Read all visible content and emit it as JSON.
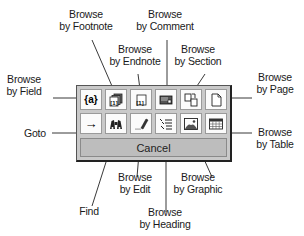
{
  "panel": {
    "row1": [
      {
        "id": "browse-by-field",
        "icon": "field-icon",
        "glyph": "{a}"
      },
      {
        "id": "browse-by-footnote",
        "icon": "footnote-icon",
        "glyph": "[1]"
      },
      {
        "id": "browse-by-endnote",
        "icon": "endnote-icon",
        "glyph": "[1]"
      },
      {
        "id": "browse-by-comment",
        "icon": "comment-icon",
        "glyph": ""
      },
      {
        "id": "browse-by-section",
        "icon": "section-icon",
        "glyph": ""
      },
      {
        "id": "browse-by-page",
        "icon": "page-icon",
        "glyph": ""
      }
    ],
    "row2": [
      {
        "id": "goto",
        "icon": "arrow-right-icon",
        "glyph": "→"
      },
      {
        "id": "find",
        "icon": "binoculars-icon",
        "glyph": ""
      },
      {
        "id": "browse-by-edit",
        "icon": "pencil-edit-icon",
        "glyph": ""
      },
      {
        "id": "browse-by-heading",
        "icon": "heading-list-icon",
        "glyph": ""
      },
      {
        "id": "browse-by-graphic",
        "icon": "picture-icon",
        "glyph": ""
      },
      {
        "id": "browse-by-table",
        "icon": "table-icon",
        "glyph": ""
      }
    ],
    "cancel_label": "Cancel"
  },
  "callouts": {
    "footnote": {
      "line1": "Browse",
      "line2": "by Footnote"
    },
    "comment": {
      "line1": "Browse",
      "line2": "by Comment"
    },
    "endnote": {
      "line1": "Browse",
      "line2": "by Endnote"
    },
    "section": {
      "line1": "Browse",
      "line2": "by Section"
    },
    "field": {
      "line1": "Browse",
      "line2": "by Field"
    },
    "page": {
      "line1": "Browse",
      "line2": "by Page"
    },
    "goto": {
      "line1": "Goto"
    },
    "table": {
      "line1": "Browse",
      "line2": "by Table"
    },
    "edit": {
      "line1": "Browse",
      "line2": "by Edit"
    },
    "graphic": {
      "line1": "Browse",
      "line2": "by Graphic"
    },
    "find": {
      "line1": "Find"
    },
    "heading": {
      "line1": "Browse",
      "line2": "by Heading"
    }
  },
  "colors": {
    "panel_bg": "#c9c9c9",
    "button_bg": "#fbfbfb",
    "cancel_bg": "#bdbdbd",
    "text": "#1a1a1a"
  }
}
